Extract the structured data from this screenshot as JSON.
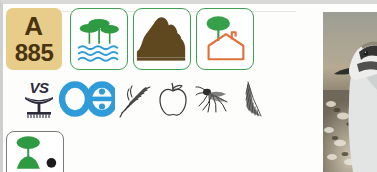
{
  "page": {
    "background_color": "#ffffff",
    "frame_color": "#d8d8d6"
  },
  "code_badge": {
    "name": "species-code-badge",
    "letter": "A",
    "number": "885",
    "background_color": "#e8cd8a",
    "text_color": "#4a3410"
  },
  "habitat_cards": [
    {
      "id": "wetland-forest",
      "icon_name": "flooded-forest-icon",
      "description": "trees over water",
      "border_color": "#3f9f54",
      "tree_color": "#2e9b43",
      "water_color": "#2f9bd8"
    },
    {
      "id": "mudflat",
      "icon_name": "mud-mound-icon",
      "description": "brown earth mound",
      "border_color": "#3f9f54",
      "mound_color": "#5f4720"
    },
    {
      "id": "garden",
      "icon_name": "tree-and-house-icon",
      "description": "tree beside house outline",
      "border_color": "#3f9f54",
      "tree_color": "#37a04a",
      "house_color": "#e0713a"
    }
  ],
  "vs_block": {
    "label": "VS",
    "glyph_name": "nest-platform-icon",
    "glyph_color": "#2a2a3c"
  },
  "egg_pair": {
    "name": "eggs-icon",
    "color": "#2f9bd8",
    "shapes": [
      "ring",
      "figure-eight"
    ]
  },
  "diet_icons": [
    {
      "id": "grain",
      "icon_name": "grain-stalk-icon",
      "color": "#3a3a3a"
    },
    {
      "id": "apple",
      "icon_name": "apple-icon",
      "color": "#3a3a3a"
    },
    {
      "id": "mosquito",
      "icon_name": "mosquito-icon",
      "color": "#2e2e2e"
    },
    {
      "id": "feather",
      "icon_name": "feather-icon",
      "color": "#4a4a4a"
    }
  ],
  "behaviour_card": {
    "id": "foliage-foraging",
    "icon_name": "tree-bush-forage-icon",
    "border_color": "#7a7a78",
    "tree_color": "#2e9b43",
    "dot_color": "#1c1c1c"
  },
  "photo": {
    "name": "bird-photograph",
    "subject": "shorebird",
    "credit": "F Li"
  }
}
